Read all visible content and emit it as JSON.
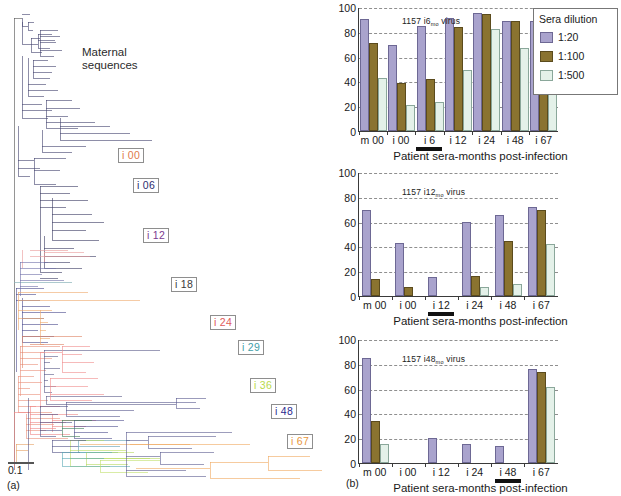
{
  "figure": {
    "panel_a_label": "(a)",
    "panel_b_label": "(b)"
  },
  "tree": {
    "annotation": "Maternal\nsequences",
    "scale_bar_value": "0.1",
    "clade_labels": [
      {
        "text": "i 00",
        "color": "#e07a4a",
        "x": 118,
        "y": 148
      },
      {
        "text": "i 06",
        "color": "#2b2b6e",
        "x": 133,
        "y": 178
      },
      {
        "text": "i 12",
        "color": "#7a3b8f",
        "x": 143,
        "y": 228
      },
      {
        "text": "i 18",
        "color": "#3a3a3a",
        "x": 171,
        "y": 277
      },
      {
        "text": "i 24",
        "color": "#e05a5a",
        "x": 210,
        "y": 315
      },
      {
        "text": "i 29",
        "color": "#3fa0a8",
        "x": 238,
        "y": 340
      },
      {
        "text": "i 36",
        "color": "#b9d94a",
        "x": 250,
        "y": 378
      },
      {
        "text": "i 48",
        "color": "#2b2b8f",
        "x": 271,
        "y": 404
      },
      {
        "text": "i 67",
        "color": "#e8963c",
        "x": 287,
        "y": 434
      }
    ]
  },
  "legend": {
    "title": "Sera dilution",
    "entries": [
      {
        "label": "1:20",
        "color": "#a9a3cd"
      },
      {
        "label": "1:100",
        "color": "#8a7330"
      },
      {
        "label": "1:500",
        "color": "#e4f1e9"
      }
    ]
  },
  "chart_data": [
    {
      "type": "bar",
      "title": "1157 i6",
      "title_sub": "mo",
      "title_suffix": " virus",
      "xlabel": "Patient sera-months post-infection",
      "ylabel": "",
      "ylim": [
        0,
        100
      ],
      "yticks": [
        "0",
        "20",
        "40",
        "60",
        "80",
        "100"
      ],
      "categories": [
        "m 00",
        "i 00",
        "i 6",
        "i 12",
        "i 24",
        "i 48",
        "i 67"
      ],
      "highlighted_category": "i 6",
      "series": [
        {
          "name": "1:20",
          "values": [
            90,
            69,
            85,
            91,
            95,
            89,
            89
          ]
        },
        {
          "name": "1:100",
          "values": [
            71,
            39,
            42,
            84,
            94,
            89,
            88
          ]
        },
        {
          "name": "1:500",
          "values": [
            43,
            21,
            23,
            49,
            82,
            67,
            60
          ]
        }
      ]
    },
    {
      "type": "bar",
      "title": "1157 i12",
      "title_sub": "mo",
      "title_suffix": " virus",
      "xlabel": "Patient sera-months post-infection",
      "ylabel": "",
      "ylim": [
        0,
        100
      ],
      "yticks": [
        "0",
        "20",
        "40",
        "60",
        "80",
        "100"
      ],
      "categories": [
        "m 00",
        "i 00",
        "i 12",
        "i 24",
        "i 48",
        "i 67"
      ],
      "highlighted_category": "i 12",
      "series": [
        {
          "name": "1:20",
          "values": [
            69,
            43,
            15,
            60,
            65,
            72
          ]
        },
        {
          "name": "1:100",
          "values": [
            14,
            7,
            0,
            16,
            44,
            69
          ]
        },
        {
          "name": "1:500",
          "values": [
            0,
            0,
            0,
            7,
            10,
            42
          ]
        }
      ]
    },
    {
      "type": "bar",
      "title": "1157 i48",
      "title_sub": "mo",
      "title_suffix": " virus",
      "xlabel": "Patient sera-months post-infection",
      "ylabel": "",
      "ylim": [
        0,
        100
      ],
      "yticks": [
        "0",
        "20",
        "40",
        "60",
        "80",
        "100"
      ],
      "categories": [
        "m 00",
        "i 00",
        "i 12",
        "i 24",
        "i 48",
        "i 67"
      ],
      "highlighted_category": "i 48",
      "series": [
        {
          "name": "1:20",
          "values": [
            85,
            0,
            20,
            15,
            14,
            76
          ]
        },
        {
          "name": "1:100",
          "values": [
            34,
            0,
            0,
            0,
            0,
            73
          ]
        },
        {
          "name": "1:500",
          "values": [
            15,
            0,
            0,
            0,
            0,
            61
          ]
        }
      ]
    }
  ]
}
